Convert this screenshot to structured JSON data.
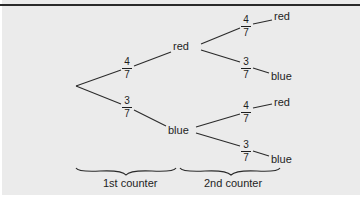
{
  "diagram": {
    "type": "probability-tree",
    "root": {
      "branches": [
        {
          "probability": {
            "numerator": "4",
            "denominator": "7"
          },
          "outcome": "red",
          "branches": [
            {
              "probability": {
                "numerator": "4",
                "denominator": "7"
              },
              "outcome": "red"
            },
            {
              "probability": {
                "numerator": "3",
                "denominator": "7"
              },
              "outcome": "blue"
            }
          ]
        },
        {
          "probability": {
            "numerator": "3",
            "denominator": "7"
          },
          "outcome": "blue",
          "branches": [
            {
              "probability": {
                "numerator": "4",
                "denominator": "7"
              },
              "outcome": "red"
            },
            {
              "probability": {
                "numerator": "3",
                "denominator": "7"
              },
              "outcome": "blue"
            }
          ]
        }
      ]
    },
    "stage_labels": [
      "1st counter",
      "2nd counter"
    ],
    "colors": {
      "background": "#ebebeb",
      "line": "#2a2a2a",
      "text": "#1e1e1e"
    }
  }
}
